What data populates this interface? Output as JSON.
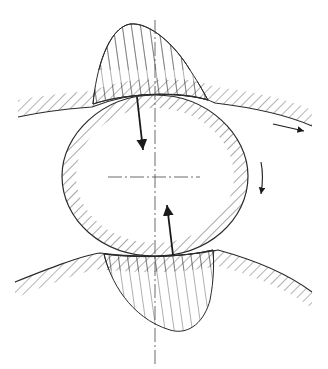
{
  "diagram": {
    "type": "technical-line-drawing",
    "colors": {
      "background": "#ffffff",
      "line": "#2a2a2a",
      "hatch": "#3a3a3a"
    },
    "elements": [
      {
        "name": "rolling-element",
        "shape": "ellipse",
        "hatched": true
      },
      {
        "name": "upper-raceway",
        "shape": "curve",
        "hatched": true
      },
      {
        "name": "lower-raceway",
        "shape": "curve",
        "hatched": true
      },
      {
        "name": "upper-pressure-distribution",
        "shape": "lobe",
        "hatched": true
      },
      {
        "name": "lower-pressure-distribution",
        "shape": "lobe",
        "hatched": true
      },
      {
        "name": "upper-contact-force-arrow",
        "direction": "down"
      },
      {
        "name": "lower-contact-force-arrow",
        "direction": "up"
      },
      {
        "name": "raceway-motion-arrow",
        "direction": "right"
      },
      {
        "name": "rotation-arrow",
        "direction": "clockwise"
      },
      {
        "name": "vertical-centerline",
        "style": "dash-dot"
      },
      {
        "name": "horizontal-centerline",
        "style": "dash-dot"
      }
    ]
  }
}
